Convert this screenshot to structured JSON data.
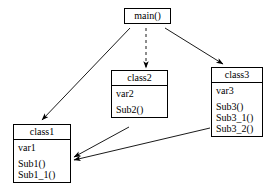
{
  "diagram": {
    "stroke_color": "#000000",
    "background_color": "#ffffff",
    "nodes": [
      {
        "id": "main",
        "name": "main()",
        "attributes": [],
        "operations": []
      },
      {
        "id": "class2",
        "name": "class2",
        "attributes": [
          "var2"
        ],
        "operations": [
          "Sub2()"
        ]
      },
      {
        "id": "class3",
        "name": "class3",
        "attributes": [
          "var3"
        ],
        "operations": [
          "Sub3()",
          "Sub3_1()",
          "Sub3_2()"
        ]
      },
      {
        "id": "class1",
        "name": "class1",
        "attributes": [
          "var1"
        ],
        "operations": [
          "Sub1()",
          "Sub1_1()"
        ]
      }
    ],
    "edges": [
      {
        "id": "main-to-class1",
        "from": "main",
        "to": "class1",
        "style": "solid",
        "arrow": "open"
      },
      {
        "id": "main-to-class2",
        "from": "main",
        "to": "class2",
        "style": "dashed",
        "arrow": "filled"
      },
      {
        "id": "main-to-class3",
        "from": "main",
        "to": "class3",
        "style": "solid",
        "arrow": "filled"
      },
      {
        "id": "class2-to-class1",
        "from": "class2",
        "to": "class1",
        "style": "solid",
        "arrow": "filled"
      },
      {
        "id": "class3-to-class1",
        "from": "class3",
        "to": "class1",
        "style": "solid",
        "arrow": "filled"
      }
    ]
  }
}
